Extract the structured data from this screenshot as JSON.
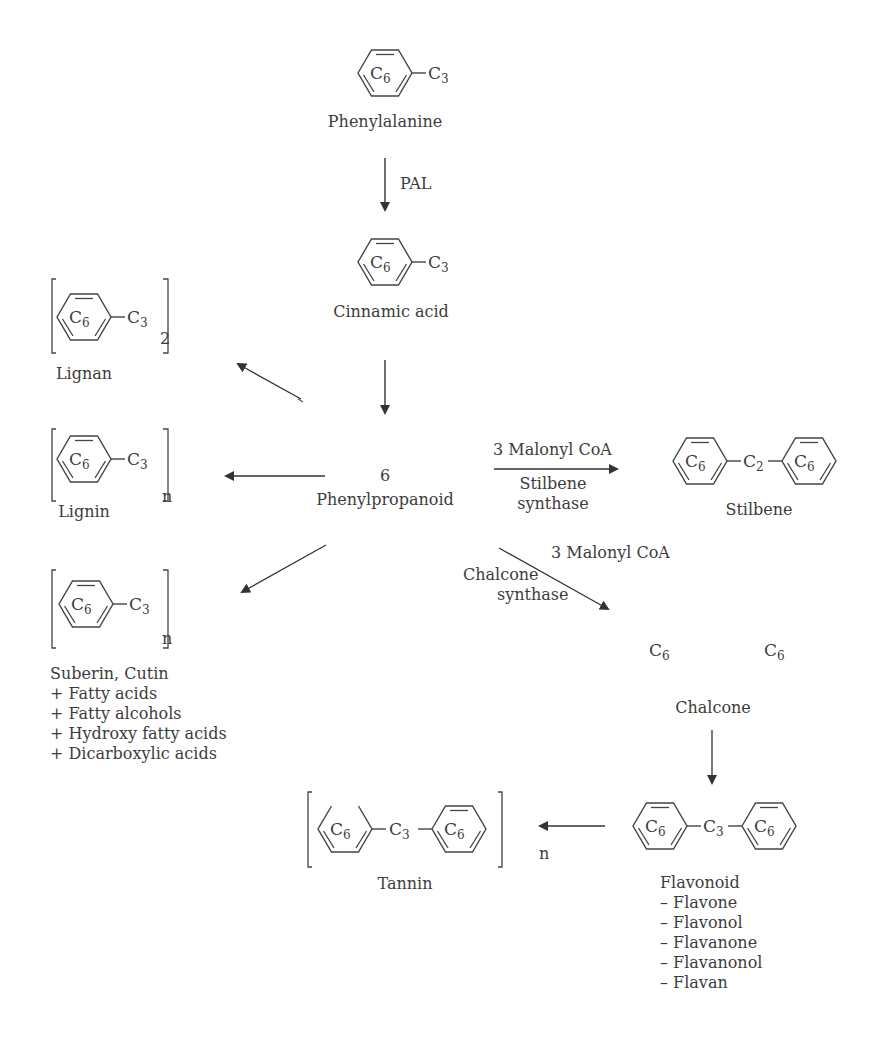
{
  "nodes": {
    "phenylalanine": {
      "label": "Phenylalanine",
      "formula": [
        "C6",
        "C3"
      ]
    },
    "cinnamic_acid": {
      "label": "Cinnamic acid",
      "formula": [
        "C6",
        "C3"
      ]
    },
    "phenylpropanoid": {
      "number": "6",
      "label": "Phenylpropanoid"
    },
    "lignan": {
      "label": "Lignan",
      "formula": [
        "C6",
        "C3"
      ],
      "subscript": "2"
    },
    "lignin": {
      "label": "Lignin",
      "formula": [
        "C6",
        "C3"
      ],
      "subscript": "n"
    },
    "suberin": {
      "formula": [
        "C6",
        "C3"
      ],
      "subscript": "n",
      "lines": [
        "Suberin, Cutin",
        "+ Fatty acids",
        "+ Fatty alcohols",
        "+ Hydroxy fatty acids",
        "+ Dicarboxylic acids"
      ]
    },
    "stilbene": {
      "label": "Stilbene",
      "formula": [
        "C6",
        "C2",
        "C6"
      ]
    },
    "chalcone": {
      "label": "Chalcone",
      "formula": [
        "C6",
        "C6"
      ]
    },
    "flavonoid": {
      "formula": [
        "C6",
        "C3",
        "C6"
      ],
      "lines": [
        "Flavonoid",
        "– Flavone",
        "– Flavonol",
        "– Flavanone",
        "– Flavanonol",
        "– Flavan"
      ]
    },
    "tannin": {
      "label": "Tannin",
      "formula": [
        "C6",
        "C3",
        "C6"
      ],
      "subscript": "n"
    }
  },
  "edges": {
    "pal": {
      "from": "phenylalanine",
      "to": "cinnamic_acid",
      "label": "PAL"
    },
    "to_phenylpropanoid": {
      "from": "cinnamic_acid",
      "to": "phenylpropanoid"
    },
    "to_lignan": {
      "from": "phenylpropanoid",
      "to": "lignan"
    },
    "to_lignin": {
      "from": "phenylpropanoid",
      "to": "lignin"
    },
    "to_suberin": {
      "from": "phenylpropanoid",
      "to": "suberin"
    },
    "stilbene_synthase": {
      "from": "phenylpropanoid",
      "to": "stilbene",
      "above": "3 Malonyl CoA",
      "below": [
        "Stilbene",
        "synthase"
      ]
    },
    "chalcone_synthase": {
      "from": "phenylpropanoid",
      "to": "chalcone",
      "above": "3 Malonyl CoA",
      "below": [
        "Chalcone",
        "synthase"
      ]
    },
    "to_flavonoid": {
      "from": "chalcone",
      "to": "flavonoid"
    },
    "to_tannin": {
      "from": "flavonoid",
      "to": "tannin"
    }
  },
  "colors": {
    "ink": "#3c3c3c",
    "background": "#ffffff"
  }
}
